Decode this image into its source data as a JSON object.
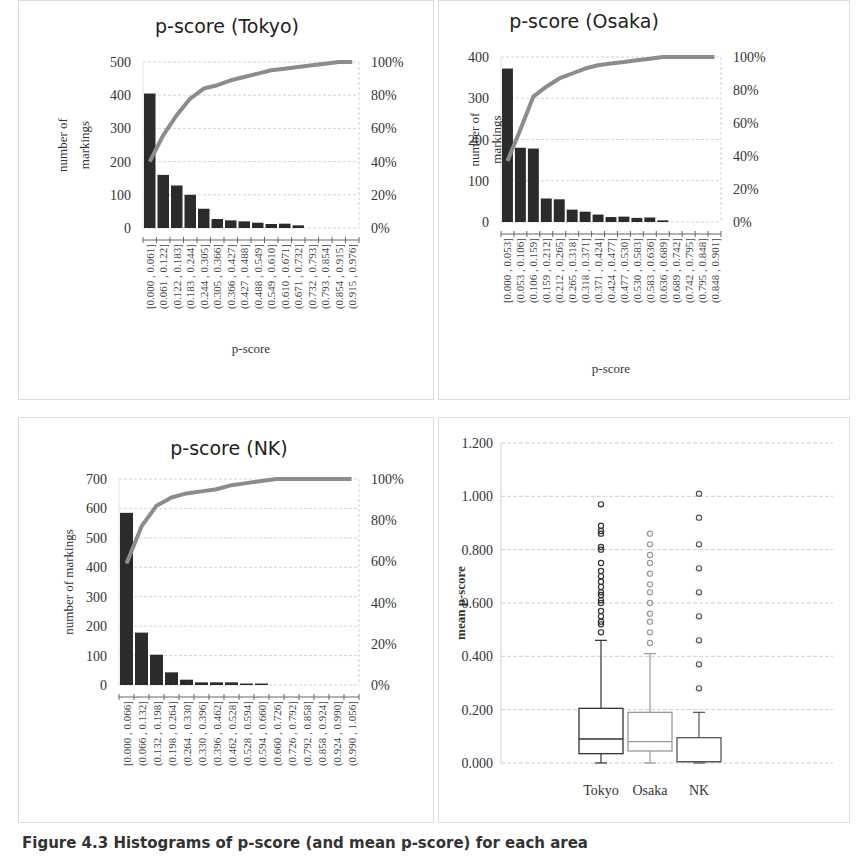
{
  "figure": {
    "caption": "Figure 4.3 Histograms of p-score (and mean p-score) for each area"
  },
  "chart_data": [
    {
      "type": "bar",
      "id": "tokyo",
      "title": "p-score (Tokyo)",
      "xlabel": "p-score",
      "ylabel": "number of markings",
      "ylim": [
        0,
        500
      ],
      "yticks": [
        0,
        100,
        200,
        300,
        400,
        500
      ],
      "y2ticks": [
        "0%",
        "20%",
        "40%",
        "60%",
        "80%",
        "100%"
      ],
      "grid": true,
      "categories": [
        "[0.000 , 0.061]",
        "(0.061 , 0.122]",
        "(0.122 , 0.183]",
        "(0.183 , 0.244]",
        "(0.244 , 0.305]",
        "(0.305 , 0.366]",
        "(0.366 , 0.427]",
        "(0.427 , 0.488]",
        "(0.488 , 0.549]",
        "(0.549 , 0.610]",
        "(0.610 , 0.671]",
        "(0.671 , 0.732]",
        "(0.732 , 0.793]",
        "(0.793 , 0.854]",
        "(0.854 , 0.915]",
        "(0.915 , 0.976]"
      ],
      "series": [
        {
          "name": "number of markings",
          "type": "bar",
          "values": [
            405,
            160,
            128,
            100,
            58,
            27,
            23,
            20,
            16,
            12,
            13,
            8,
            0,
            0,
            0,
            0
          ]
        },
        {
          "name": "cumulative %",
          "type": "line",
          "axis": "right",
          "values": [
            40,
            56,
            68,
            78,
            84,
            86,
            89,
            91,
            93,
            95,
            96,
            97,
            98,
            99,
            100,
            100
          ]
        }
      ]
    },
    {
      "type": "bar",
      "id": "osaka",
      "title": "p-score (Osaka)",
      "xlabel": "p-score",
      "ylabel": "number of markings",
      "ylim": [
        0,
        400
      ],
      "yticks": [
        0,
        100,
        200,
        300,
        400
      ],
      "y2ticks": [
        "0%",
        "20%",
        "40%",
        "60%",
        "80%",
        "100%"
      ],
      "grid": true,
      "categories": [
        "[0.000 , 0.053]",
        "(0.053 , 0.106]",
        "(0.106 , 0.159]",
        "(0.159 , 0.212]",
        "(0.212 , 0.265]",
        "(0.265 , 0.318]",
        "(0.318 , 0.371]",
        "(0.371 , 0.424]",
        "(0.424 , 0.477]",
        "(0.477 , 0.530]",
        "(0.530 , 0.583]",
        "(0.583 , 0.636]",
        "(0.636 , 0.689]",
        "(0.689 , 0.742]",
        "(0.742 , 0.795]",
        "(0.795 , 0.848]",
        "(0.848 , 0.901]"
      ],
      "series": [
        {
          "name": "number of markings",
          "type": "bar",
          "values": [
            372,
            180,
            178,
            57,
            55,
            30,
            25,
            18,
            12,
            13,
            10,
            11,
            4,
            0,
            0,
            0,
            0
          ]
        },
        {
          "name": "cumulative %",
          "type": "line",
          "axis": "right",
          "values": [
            37,
            56,
            76,
            82,
            87,
            90,
            93,
            95,
            96,
            97,
            98,
            99,
            100,
            100,
            100,
            100,
            100
          ]
        }
      ]
    },
    {
      "type": "bar",
      "id": "nk",
      "title": "p-score (NK)",
      "xlabel": "",
      "ylabel": "number of markings",
      "ylim": [
        0,
        700
      ],
      "yticks": [
        0,
        100,
        200,
        300,
        400,
        500,
        600,
        700
      ],
      "y2ticks": [
        "0%",
        "20%",
        "40%",
        "60%",
        "80%",
        "100%"
      ],
      "grid": true,
      "categories": [
        "[0.000 , 0.066]",
        "(0.066 , 0.132]",
        "(0.132 , 0.198]",
        "(0.198 , 0.264]",
        "(0.264 , 0.330]",
        "(0.330 , 0.396]",
        "(0.396 , 0.462]",
        "(0.462 , 0.528]",
        "(0.528 , 0.594]",
        "(0.594 , 0.660]",
        "(0.660 , 0.726]",
        "(0.726 , 0.792]",
        "(0.792 , 0.858]",
        "(0.858 , 0.924]",
        "(0.924 , 0.990]",
        "(0.990 , 1.056]"
      ],
      "series": [
        {
          "name": "number of markings",
          "type": "bar",
          "values": [
            585,
            178,
            103,
            43,
            18,
            9,
            9,
            9,
            5,
            5,
            0,
            0,
            0,
            0,
            0,
            0
          ]
        },
        {
          "name": "cumulative %",
          "type": "line",
          "axis": "right",
          "values": [
            59,
            77,
            87,
            91,
            93,
            94,
            95,
            97,
            98,
            99,
            100,
            100,
            100,
            100,
            100,
            100
          ]
        }
      ]
    },
    {
      "type": "box",
      "id": "boxplot",
      "title": "",
      "xlabel": "",
      "ylabel": "mean p-score",
      "ylim": [
        0,
        1.2
      ],
      "yticks": [
        "0.000",
        "0.200",
        "0.400",
        "0.600",
        "0.800",
        "1.000",
        "1.200"
      ],
      "grid": true,
      "categories": [
        "Tokyo",
        "Osaka",
        "NK"
      ],
      "series": [
        {
          "name": "Tokyo",
          "color": "#333333",
          "min": 0.0,
          "q1": 0.035,
          "median": 0.09,
          "q3": 0.205,
          "max": 0.46,
          "outliers": [
            0.49,
            0.52,
            0.53,
            0.55,
            0.57,
            0.6,
            0.61,
            0.63,
            0.64,
            0.66,
            0.68,
            0.7,
            0.72,
            0.75,
            0.8,
            0.81,
            0.86,
            0.87,
            0.89,
            0.97
          ]
        },
        {
          "name": "Osaka",
          "color": "#999999",
          "min": 0.0,
          "q1": 0.045,
          "median": 0.08,
          "q3": 0.19,
          "max": 0.41,
          "outliers": [
            0.45,
            0.49,
            0.53,
            0.56,
            0.6,
            0.64,
            0.67,
            0.71,
            0.75,
            0.78,
            0.82,
            0.86
          ]
        },
        {
          "name": "NK",
          "color": "#555555",
          "min": 0.0,
          "q1": 0.005,
          "median": 0.005,
          "q3": 0.095,
          "max": 0.19,
          "outliers": [
            0.28,
            0.37,
            0.46,
            0.55,
            0.64,
            0.73,
            0.82,
            0.92,
            1.01
          ]
        }
      ]
    }
  ]
}
